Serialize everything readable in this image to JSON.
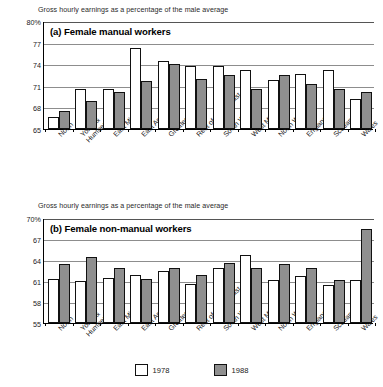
{
  "figure": {
    "legend": [
      {
        "label": "1978",
        "color": "#ffffff",
        "swatch": "white"
      },
      {
        "label": "1988",
        "color": "#8f8f8f",
        "swatch": "grey"
      }
    ]
  },
  "chart_data": [
    {
      "type": "bar",
      "panel": "(a)",
      "title": "(a) Female manual workers",
      "caption": "Gross hourly earnings as a percentage of the male average",
      "xlabel": "",
      "ylabel": "",
      "ylim": [
        65,
        80
      ],
      "yticks": [
        65,
        68,
        71,
        74,
        77,
        80
      ],
      "ytick_labels": [
        "65",
        "68",
        "71",
        "74",
        "77",
        "80%"
      ],
      "grid": true,
      "legend_position": "bottom",
      "categories": [
        "North",
        "Yorks & Humberside",
        "East Midlands",
        "East Anglia",
        "Greater London",
        "Rest of South East",
        "South West",
        "West Midlands",
        "North West",
        "England",
        "Scotland",
        "Wales"
      ],
      "series": [
        {
          "name": "1978",
          "values": [
            66.6,
            70.5,
            70.5,
            76.2,
            74.5,
            73.8,
            73.7,
            73.2,
            71.8,
            72.6,
            73.2,
            69.1
          ]
        },
        {
          "name": "1988",
          "values": [
            67.5,
            68.9,
            70.1,
            71.6,
            74.0,
            72.0,
            72.5,
            70.5,
            72.5,
            71.2,
            70.5,
            70.1
          ]
        }
      ]
    },
    {
      "type": "bar",
      "panel": "(b)",
      "title": "(b) Female non-manual workers",
      "caption": "Gross hourly earnings as a percentage of the male average",
      "xlabel": "",
      "ylabel": "",
      "ylim": [
        55,
        70
      ],
      "yticks": [
        55,
        58,
        61,
        64,
        67,
        70
      ],
      "ytick_labels": [
        "55",
        "58",
        "61",
        "64",
        "67",
        "70%"
      ],
      "grid": true,
      "legend_position": "bottom",
      "categories": [
        "North",
        "Yorks & Humberside",
        "East Midlands",
        "East Anglia",
        "Greater London",
        "Rest of South East",
        "South West",
        "West Midlands",
        "North West",
        "England",
        "Scotland",
        "Wales"
      ],
      "series": [
        {
          "name": "1978",
          "values": [
            61.3,
            61.0,
            61.4,
            61.9,
            62.5,
            60.6,
            62.9,
            64.7,
            61.1,
            61.7,
            60.4,
            61.1
          ]
        },
        {
          "name": "1988",
          "values": [
            63.5,
            64.4,
            62.8,
            61.3,
            62.8,
            61.9,
            63.6,
            62.8,
            63.5,
            62.8,
            61.1,
            68.5
          ]
        }
      ]
    }
  ]
}
